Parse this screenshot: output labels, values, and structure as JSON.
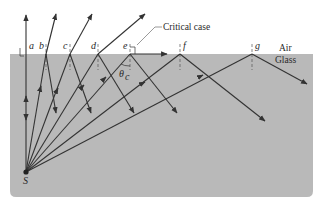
{
  "figure": {
    "colors": {
      "glass": "#b9b9b9",
      "air": "#ffffff",
      "ray": "#333333",
      "normal": "#555555"
    },
    "media": {
      "upper": "Air",
      "lower": "Glass"
    },
    "source_label": "S",
    "annotation": "Critical case",
    "angle_label": "θ",
    "angle_subscript": "c",
    "points": [
      {
        "id": "a",
        "label": "a",
        "x": 26
      },
      {
        "id": "b",
        "label": "b",
        "x": 46
      },
      {
        "id": "c",
        "label": "c",
        "x": 70
      },
      {
        "id": "d",
        "label": "d",
        "x": 98
      },
      {
        "id": "e",
        "label": "e",
        "x": 130
      },
      {
        "id": "f",
        "label": "f",
        "x": 180
      },
      {
        "id": "g",
        "label": "g",
        "x": 252
      }
    ]
  }
}
